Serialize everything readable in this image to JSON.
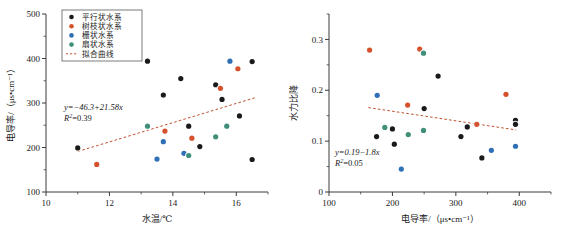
{
  "figure": {
    "background": "#ffffff",
    "panel_count": 2
  },
  "palette": {
    "parallel": "#1a1a1a",
    "dendritic": "#d4512b",
    "trellis": "#2f6fb5",
    "fan": "#3f8f7a",
    "fit_curve": "#c0512f",
    "axis": "#3b3b3b"
  },
  "legend": {
    "position": "top-left",
    "items": [
      {
        "label": "平行状水系",
        "color": "#1a1a1a",
        "marker": "circle"
      },
      {
        "label": "树枝状水系",
        "color": "#d4512b",
        "marker": "circle"
      },
      {
        "label": "栅状水系",
        "color": "#2f6fb5",
        "marker": "circle"
      },
      {
        "label": "扇状水系",
        "color": "#3f8f7a",
        "marker": "circle"
      },
      {
        "label": "拟合曲线",
        "color": "#c0512f",
        "marker": "dashed-line"
      }
    ]
  },
  "chart_data": [
    {
      "id": "left",
      "type": "scatter",
      "title": "",
      "xlabel": "水温/℃",
      "ylabel": "电导率/（μs•cm⁻¹）",
      "xlim": [
        10,
        17
      ],
      "ylim": [
        100,
        500
      ],
      "xticks": [
        10,
        12,
        14,
        16
      ],
      "xticklabels": [
        "10",
        "12",
        "14",
        "16"
      ],
      "xminor": [
        11,
        13,
        15,
        17
      ],
      "yticks": [
        100,
        200,
        300,
        400,
        500
      ],
      "yticklabels": [
        "100",
        "200",
        "300",
        "400",
        "500"
      ],
      "yminor": [
        150,
        250,
        350,
        450
      ],
      "grid": false,
      "annotation": {
        "equation": "y=−46.3+21.58x",
        "r2_label": "R",
        "r2_sup": "2",
        "r2_value": "=0.39"
      },
      "fit": {
        "x0": 11.0,
        "y0": 191.0,
        "x1": 16.6,
        "y1": 312.0
      },
      "series": [
        {
          "name": "平行状水系",
          "color": "#1a1a1a",
          "points": [
            [
              11.0,
              199
            ],
            [
              13.2,
              394
            ],
            [
              13.7,
              318
            ],
            [
              14.25,
              355
            ],
            [
              14.5,
              248
            ],
            [
              14.85,
              202
            ],
            [
              15.35,
              341
            ],
            [
              15.55,
              308
            ],
            [
              16.1,
              271
            ],
            [
              16.5,
              393
            ],
            [
              16.5,
              173
            ]
          ]
        },
        {
          "name": "树枝状水系",
          "color": "#d4512b",
          "points": [
            [
              11.6,
              162
            ],
            [
              13.75,
              237
            ],
            [
              14.6,
              221
            ],
            [
              15.5,
              333
            ],
            [
              16.05,
              377
            ]
          ]
        },
        {
          "name": "栅状水系",
          "color": "#2f6fb5",
          "points": [
            [
              13.5,
              174
            ],
            [
              13.7,
              213
            ],
            [
              14.35,
              187
            ],
            [
              15.8,
              394
            ]
          ]
        },
        {
          "name": "扇状水系",
          "color": "#3f8f7a",
          "points": [
            [
              13.2,
              248
            ],
            [
              14.5,
              182
            ],
            [
              15.35,
              224
            ],
            [
              15.7,
              248
            ]
          ]
        }
      ]
    },
    {
      "id": "right",
      "type": "scatter",
      "title": "",
      "xlabel": "电导率/（μs•cm⁻¹）",
      "ylabel": "水力比降",
      "xlim": [
        100,
        450
      ],
      "ylim": [
        0,
        0.35
      ],
      "xticks": [
        100,
        200,
        300,
        400
      ],
      "xticklabels": [
        "100",
        "200",
        "300",
        "400"
      ],
      "xminor": [
        150,
        250,
        350,
        450
      ],
      "yticks": [
        0,
        0.1,
        0.2,
        0.3
      ],
      "yticklabels": [
        "0",
        "0.1",
        "0.2",
        "0.3"
      ],
      "yminor": [
        0.05,
        0.15,
        0.25,
        0.35
      ],
      "grid": false,
      "annotation": {
        "equation": "y=0.19−1.8x",
        "r2_label": "R",
        "r2_sup": "2",
        "r2_value": "=0.05"
      },
      "fit": {
        "x0": 162,
        "y0": 0.166,
        "x1": 395,
        "y1": 0.122
      },
      "series": [
        {
          "name": "平行状水系",
          "color": "#1a1a1a",
          "points": [
            [
              175,
              0.109
            ],
            [
              200,
              0.124
            ],
            [
              203,
              0.094
            ],
            [
              250,
              0.164
            ],
            [
              272,
              0.228
            ],
            [
              308,
              0.109
            ],
            [
              318,
              0.128
            ],
            [
              341,
              0.067
            ],
            [
              394,
              0.141
            ],
            [
              394,
              0.133
            ]
          ]
        },
        {
          "name": "树枝状水系",
          "color": "#d4512b",
          "points": [
            [
              164,
              0.279
            ],
            [
              224,
              0.171
            ],
            [
              243,
              0.281
            ],
            [
              333,
              0.133
            ],
            [
              379,
              0.192
            ]
          ]
        },
        {
          "name": "栅状水系",
          "color": "#2f6fb5",
          "points": [
            [
              176,
              0.19
            ],
            [
              214,
              0.045
            ],
            [
              356,
              0.082
            ],
            [
              394,
              0.09
            ]
          ]
        },
        {
          "name": "扇状水系",
          "color": "#3f8f7a",
          "points": [
            [
              188,
              0.127
            ],
            [
              225,
              0.113
            ],
            [
              249,
              0.121
            ],
            [
              249,
              0.273
            ]
          ]
        }
      ]
    }
  ]
}
